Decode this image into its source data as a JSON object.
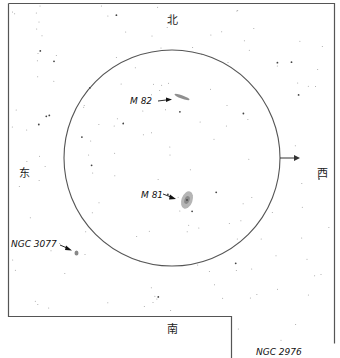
{
  "chart_data": {
    "type": "star-chart",
    "title": "",
    "directions": {
      "north": "北",
      "south": "南",
      "east": "东",
      "west": "西"
    },
    "field_of_view": {
      "shape": "circle",
      "motion_arrow_direction": "west"
    },
    "objects": [
      {
        "id": "m82",
        "label": "M 82",
        "kind": "edge-on galaxy",
        "in_field": true
      },
      {
        "id": "m81",
        "label": "M 81",
        "kind": "spiral galaxy",
        "in_field": true
      },
      {
        "id": "ngc3077",
        "label": "NGC 3077",
        "kind": "galaxy",
        "in_field": false
      },
      {
        "id": "ngc2976",
        "label": "NGC 2976",
        "kind": "galaxy",
        "in_field": false
      }
    ],
    "colors": {
      "frame": "#555555",
      "circle": "#555555",
      "text": "#111111",
      "stars": "#8a8a8a",
      "galaxy": "#9a9a9a"
    }
  }
}
